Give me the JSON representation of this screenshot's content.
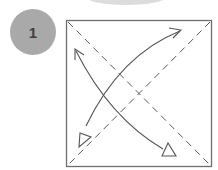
{
  "step": {
    "number": "1"
  },
  "diagram": {
    "colors": {
      "badge": "#a9a9a9",
      "badge_text": "#3f3f3f",
      "lines": "#5a5a5a",
      "square_border": "#6e6e6e",
      "top_arc": "#dcdcdc"
    }
  }
}
